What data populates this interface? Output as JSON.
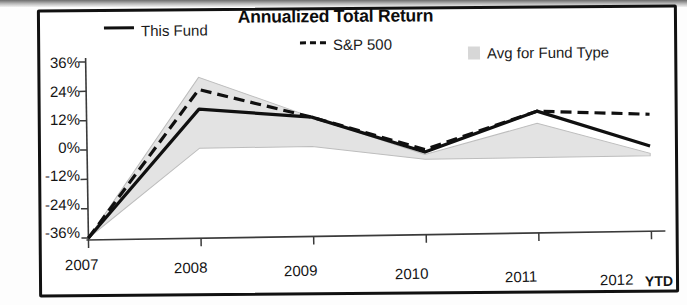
{
  "chart_data": {
    "type": "line",
    "title": "Annualized Total Return",
    "xlabel": "",
    "ylabel": "",
    "categories": [
      "2007",
      "2008",
      "2009",
      "2010",
      "2011",
      "2012 YTD"
    ],
    "x_tick_labels": [
      "2007",
      "2008",
      "2009",
      "2010",
      "2011",
      "2012"
    ],
    "x_axis_suffix": "YTD",
    "y_tick_labels": [
      "36%",
      "24%",
      "12%",
      "0%",
      "-12%",
      "-24%",
      "-36%"
    ],
    "y_tick_values": [
      36,
      24,
      12,
      0,
      -12,
      -24,
      -36
    ],
    "ylim": [
      -36,
      36
    ],
    "grid": false,
    "legend_position": "top",
    "series": [
      {
        "name": "This Fund",
        "style": "solid",
        "color": "#101010",
        "values": [
          -36,
          16,
          12,
          -3,
          13,
          -2
        ]
      },
      {
        "name": "S&P 500",
        "style": "dashed",
        "color": "#101010",
        "values": [
          -36,
          24,
          12,
          -2,
          13,
          11
        ]
      },
      {
        "name": "Avg for Fund Type",
        "style": "band",
        "color": "#c9c9c9",
        "band_upper": [
          -36,
          29,
          12,
          -4,
          8,
          -5
        ],
        "band_lower": [
          -36,
          0,
          0,
          -6,
          -6,
          -6
        ]
      }
    ],
    "legend": [
      {
        "label": "This Fund",
        "marker": "solid-line"
      },
      {
        "label": "S&P 500",
        "marker": "dashed-line"
      },
      {
        "label": "Avg for Fund Type",
        "marker": "gray-swatch"
      }
    ]
  }
}
